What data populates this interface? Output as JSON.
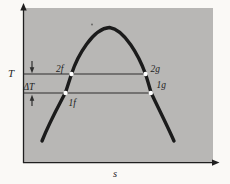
{
  "figure": {
    "kind": "temperature-entropy saturation dome diagram",
    "labels": {
      "y_axis": "T",
      "x_axis": "s",
      "delta": "ΔT",
      "p2f": "2f",
      "p2g": "2g",
      "p1f": "1f",
      "p1g": "1g"
    },
    "points": [
      {
        "label": "2f",
        "isotherm": "upper",
        "branch": "left"
      },
      {
        "label": "2g",
        "isotherm": "upper",
        "branch": "right"
      },
      {
        "label": "1f",
        "isotherm": "lower",
        "branch": "left"
      },
      {
        "label": "1g",
        "isotherm": "lower",
        "branch": "right"
      }
    ],
    "colors": {
      "page_bg": "#faf9f6",
      "plot_bg": "#b8b7b5",
      "curve": "#1b1b1b",
      "line": "#2e2e2e",
      "axis": "#1f1f1f",
      "text": "#1e1e1e",
      "marker": "#ffffff"
    }
  }
}
